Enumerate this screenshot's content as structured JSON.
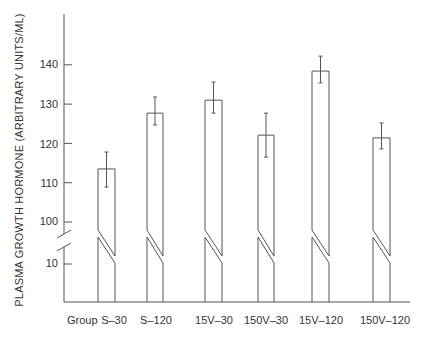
{
  "chart_data": {
    "type": "bar",
    "title": "",
    "xlabel": "Group",
    "ylabel": "PLASMA GROWTH HORMONE (ARBITRARY UNITS/ML)",
    "categories": [
      "S–30",
      "S–120",
      "15V–30",
      "150V–30",
      "15V–120",
      "150V–120"
    ],
    "series": [
      {
        "name": "Plasma growth hormone",
        "values": [
          113.5,
          127.7,
          131.0,
          122.1,
          138.4,
          121.4
        ],
        "error_upper": [
          117.8,
          131.8,
          135.6,
          127.7,
          142.2,
          125.2
        ],
        "error_lower": [
          108.9,
          124.7,
          127.7,
          116.5,
          135.4,
          118.6
        ]
      }
    ],
    "y_ticks": [
      "140",
      "130",
      "120",
      "110",
      "100",
      "10"
    ],
    "y_tick_values": [
      140,
      130,
      120,
      110,
      100,
      10
    ],
    "axis_break": "between 10 and 100",
    "ylim": [
      0,
      150
    ],
    "grid": false,
    "legend": "none",
    "colors": {
      "line": "#555555",
      "text": "#333333",
      "background": "#ffffff"
    }
  }
}
